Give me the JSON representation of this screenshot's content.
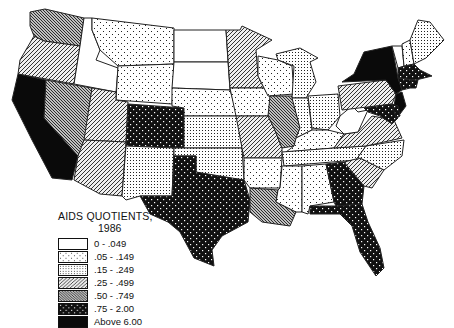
{
  "legend": {
    "title": "AIDS QUOTIENTS,",
    "year": "1986",
    "classes": [
      {
        "label": "0 - .049",
        "pattern": "p0"
      },
      {
        "label": ".05 - .149",
        "pattern": "p1"
      },
      {
        "label": ".15 - .249",
        "pattern": "p2"
      },
      {
        "label": ".25 - .499",
        "pattern": "p3"
      },
      {
        "label": ".50 - .749",
        "pattern": "p4"
      },
      {
        "label": ".75 - 2.00",
        "pattern": "p5"
      },
      {
        "label": "Above 6.00",
        "pattern": "p6"
      }
    ]
  },
  "states": {
    "WA": ".50 - .749",
    "OR": ".25 - .499",
    "CA": "Above 6.00",
    "NV": ".50 - .749",
    "ID": "0 - .049",
    "MT": ".05 - .149",
    "WY": ".05 - .149",
    "UT": ".25 - .499",
    "AZ": ".25 - .499",
    "CO": ".75 - 2.00",
    "NM": ".15 - .249",
    "ND": "0 - .049",
    "SD": "0 - .049",
    "NE": ".05 - .149",
    "KS": ".15 - .249",
    "OK": ".15 - .249",
    "TX": ".75 - 2.00",
    "MN": ".25 - .499",
    "IA": ".05 - .149",
    "MO": ".25 - .499",
    "AR": ".05 - .149",
    "LA": ".50 - .749",
    "WI": ".05 - .149",
    "IL": ".50 - .749",
    "MI": ".15 - .249",
    "IN": ".15 - .249",
    "OH": ".15 - .249",
    "KY": ".05 - .149",
    "TN": ".15 - .249",
    "MS": ".05 - .149",
    "AL": ".05 - .149",
    "GA": ".75 - 2.00",
    "FL": ".75 - 2.00",
    "SC": ".25 - .499",
    "NC": ".15 - .249",
    "VA": ".25 - .499",
    "WV": "0 - .049",
    "PA": ".25 - .499",
    "NY": "Above 6.00",
    "NJ": "Above 6.00",
    "MD": ".75 - 2.00",
    "DE": ".75 - 2.00",
    "CT": ".75 - 2.00",
    "MA": ".75 - 2.00",
    "RI": ".75 - 2.00",
    "VT": "0 - .049",
    "NH": ".05 - .149",
    "ME": ".15 - .249"
  }
}
